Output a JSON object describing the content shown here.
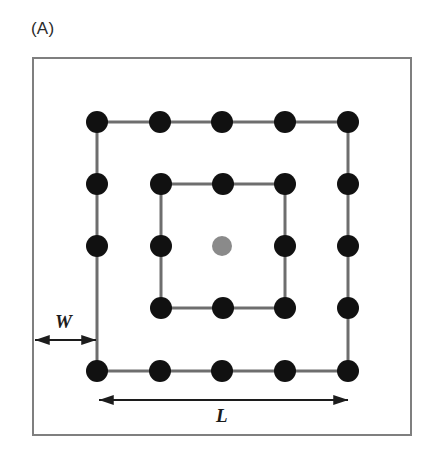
{
  "figure": {
    "panel_label": "(A)",
    "frame": {
      "x": 32,
      "y": 57,
      "width": 380,
      "height": 379,
      "stroke_color": "#7f7f7f",
      "stroke_width": 2,
      "fill_color": "#ffffff"
    },
    "colors": {
      "node_black": "#111111",
      "node_gray": "#8a8a8a",
      "line_gray": "#6e6e6e",
      "frame_gray": "#7f7f7f",
      "arrow_black": "#1c1c1c",
      "background": "#ffffff",
      "text": "#2b2b2b"
    },
    "geometry": {
      "outer_square": {
        "left": 97,
        "top": 122,
        "right": 348,
        "bottom": 371,
        "nodes_per_side": 5,
        "stroke_width": 3
      },
      "inner_square": {
        "left": 161,
        "top": 184,
        "right": 285,
        "bottom": 308,
        "nodes_per_side": 3,
        "stroke_width": 3
      },
      "node_radius": 11,
      "center_node_radius": 10
    },
    "nodes": {
      "black": [
        {
          "cx": 97,
          "cy": 122,
          "name": "node-outer-top-left"
        },
        {
          "cx": 160,
          "cy": 122,
          "name": "node-outer-top-2"
        },
        {
          "cx": 222,
          "cy": 122,
          "name": "node-outer-top-3"
        },
        {
          "cx": 285,
          "cy": 122,
          "name": "node-outer-top-4"
        },
        {
          "cx": 348,
          "cy": 122,
          "name": "node-outer-top-right"
        },
        {
          "cx": 97,
          "cy": 184,
          "name": "node-outer-left-2"
        },
        {
          "cx": 348,
          "cy": 184,
          "name": "node-outer-right-2"
        },
        {
          "cx": 97,
          "cy": 246,
          "name": "node-outer-left-3"
        },
        {
          "cx": 348,
          "cy": 246,
          "name": "node-outer-right-3"
        },
        {
          "cx": 348,
          "cy": 308,
          "name": "node-outer-right-4"
        },
        {
          "cx": 97,
          "cy": 371,
          "name": "node-outer-bottom-left"
        },
        {
          "cx": 160,
          "cy": 371,
          "name": "node-outer-bottom-2"
        },
        {
          "cx": 222,
          "cy": 371,
          "name": "node-outer-bottom-3"
        },
        {
          "cx": 285,
          "cy": 371,
          "name": "node-outer-bottom-4"
        },
        {
          "cx": 348,
          "cy": 371,
          "name": "node-outer-bottom-right"
        },
        {
          "cx": 161,
          "cy": 184,
          "name": "node-inner-top-left"
        },
        {
          "cx": 223,
          "cy": 184,
          "name": "node-inner-top-mid"
        },
        {
          "cx": 285,
          "cy": 184,
          "name": "node-inner-top-right"
        },
        {
          "cx": 161,
          "cy": 246,
          "name": "node-inner-left-mid"
        },
        {
          "cx": 285,
          "cy": 246,
          "name": "node-inner-right-mid"
        },
        {
          "cx": 161,
          "cy": 308,
          "name": "node-inner-bottom-left"
        },
        {
          "cx": 223,
          "cy": 308,
          "name": "node-inner-bottom-mid"
        },
        {
          "cx": 285,
          "cy": 308,
          "name": "node-inner-bottom-right"
        }
      ],
      "gray": [
        {
          "cx": 222,
          "cy": 246,
          "name": "node-center-gray"
        }
      ]
    },
    "dimensions": [
      {
        "id": "w",
        "label": "W",
        "orientation": "horizontal",
        "x1": 35,
        "x2": 96,
        "y": 340,
        "label_x": 55,
        "label_y": 312,
        "meaning": "gap between outer frame edge and outer node square"
      },
      {
        "id": "l",
        "label": "L",
        "orientation": "horizontal",
        "x1": 99,
        "x2": 348,
        "y": 400,
        "label_x": 216,
        "label_y": 406,
        "meaning": "side length of the outer node square"
      }
    ]
  }
}
